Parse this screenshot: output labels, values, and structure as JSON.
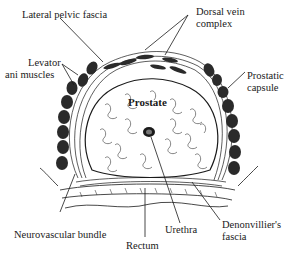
{
  "diagram": {
    "title": "",
    "labels": {
      "lateral_pelvic_fascia": "Lateral pelvic fascia",
      "dorsal_vein_complex_1": "Dorsal vein",
      "dorsal_vein_complex_2": "complex",
      "levator_ani_1": "Levator",
      "levator_ani_2": "ani muscles",
      "prostatic_capsule_1": "Prostatic",
      "prostatic_capsule_2": "capsule",
      "prostate": "Prostate",
      "neurovascular_bundle": "Neurovascular bundle",
      "urethra": "Urethra",
      "denonvilliers_fascia_1": "Denonvillier's",
      "denonvilliers_fascia_2": "fascia",
      "rectum": "Rectum"
    },
    "colors": {
      "ink": "#1a1a1a",
      "muscle": "#2a2a2a",
      "background": "#ffffff"
    }
  }
}
